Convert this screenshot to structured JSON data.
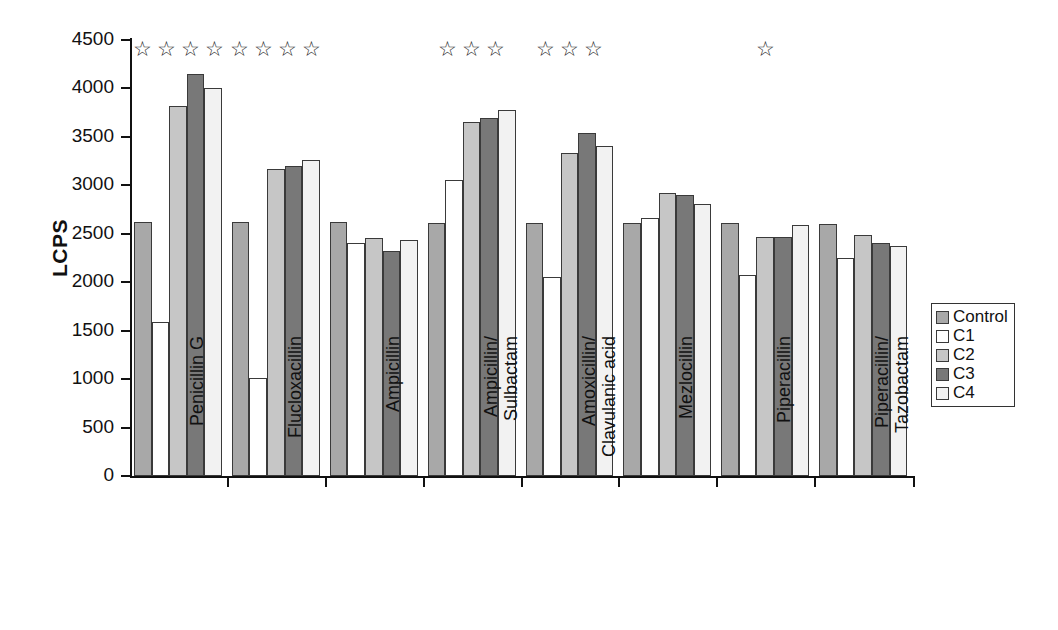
{
  "chart_data": {
    "type": "bar",
    "title": "",
    "xlabel": "",
    "ylabel": "LCPS",
    "ylim": [
      0,
      4500
    ],
    "ytick_values": [
      0,
      500,
      1000,
      1500,
      2000,
      2500,
      3000,
      3500,
      4000,
      4500
    ],
    "ytick_labels": [
      "0",
      "500",
      "1000",
      "1500",
      "2000",
      "2500",
      "3000",
      "3500",
      "4000",
      "4500"
    ],
    "grid": false,
    "legend_position": "right",
    "categories": [
      "Penicillin G",
      "Flucloxacillin",
      "Ampicillin",
      "Ampicillin/ Sulbactam",
      "Amoxicillin/ Clavulanic acid",
      "Mezlocillin",
      "Piperacillin",
      "Piperacillin/ Tazobactam"
    ],
    "category_lines": [
      [
        "Penicillin G",
        ""
      ],
      [
        "Flucloxacillin",
        ""
      ],
      [
        "Ampicillin",
        ""
      ],
      [
        "Ampicillin/",
        "Sulbactam"
      ],
      [
        "Amoxicillin/",
        "Clavulanic acid"
      ],
      [
        "Mezlocillin",
        ""
      ],
      [
        "Piperacillin",
        ""
      ],
      [
        "Piperacillin/",
        "Tazobactam"
      ]
    ],
    "series": [
      {
        "name": "Control",
        "color": "#a8a8a8",
        "values": [
          2620,
          2620,
          2620,
          2610,
          2610,
          2610,
          2610,
          2600
        ]
      },
      {
        "name": "C1",
        "color": "#ffffff",
        "values": [
          1590,
          1010,
          2410,
          3060,
          2050,
          2660,
          2070,
          2250
        ]
      },
      {
        "name": "C2",
        "color": "#c6c6c6",
        "values": [
          3820,
          3170,
          2460,
          3650,
          3330,
          2920,
          2470,
          2490
        ]
      },
      {
        "name": "C3",
        "color": "#787878",
        "values": [
          4150,
          3200,
          2320,
          3700,
          3540,
          2900,
          2470,
          2410
        ]
      },
      {
        "name": "C4",
        "color": "#f2f2f2",
        "values": [
          4000,
          3260,
          2440,
          3780,
          3410,
          2810,
          2590,
          2370
        ]
      }
    ],
    "significance_stars": [
      4,
      4,
      0,
      3,
      3,
      0,
      1,
      0
    ],
    "star_glyph": "☆"
  },
  "legend": {
    "items": [
      {
        "label": "Control",
        "color": "#a8a8a8"
      },
      {
        "label": "C1",
        "color": "#ffffff"
      },
      {
        "label": "C2",
        "color": "#c6c6c6"
      },
      {
        "label": "C3",
        "color": "#787878"
      },
      {
        "label": "C4",
        "color": "#f2f2f2"
      }
    ]
  }
}
